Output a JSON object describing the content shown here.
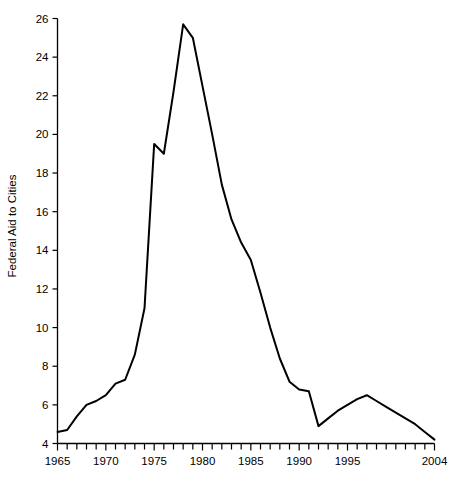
{
  "chart_data": {
    "type": "line",
    "title": "",
    "xlabel": "",
    "ylabel": "Federal Aid to Cities",
    "xlim": [
      1965,
      2004
    ],
    "ylim": [
      4,
      26
    ],
    "grid": false,
    "legend": false,
    "x_ticks_major": [
      1965,
      1970,
      1975,
      1980,
      1985,
      1990,
      1995,
      2004
    ],
    "x_tick_labels": [
      "1965",
      "1970",
      "1975",
      "1980",
      "1985",
      "1990",
      "1995",
      "2004"
    ],
    "x_minor_tick_step": 1,
    "y_ticks": [
      4,
      6,
      8,
      10,
      12,
      14,
      16,
      18,
      20,
      22,
      24,
      26
    ],
    "y_tick_labels": [
      "4",
      "6",
      "8",
      "10",
      "12",
      "14",
      "16",
      "18",
      "20",
      "22",
      "24",
      "26"
    ],
    "series": [
      {
        "name": "Federal Aid to Cities",
        "color": "#000000",
        "x": [
          1965,
          1966,
          1967,
          1968,
          1969,
          1970,
          1971,
          1972,
          1973,
          1974,
          1975,
          1976,
          1977,
          1978,
          1979,
          1980,
          1981,
          1982,
          1983,
          1984,
          1985,
          1986,
          1987,
          1988,
          1989,
          1990,
          1991,
          1992,
          1993,
          1994,
          1995,
          1996,
          1997,
          1998,
          1999,
          2000,
          2001,
          2002,
          2003,
          2004
        ],
        "values": [
          4.6,
          4.7,
          5.4,
          6.0,
          6.2,
          6.5,
          7.1,
          7.3,
          8.6,
          11.0,
          19.5,
          19.0,
          22.2,
          25.7,
          25.0,
          22.5,
          20.0,
          17.4,
          15.6,
          14.4,
          13.5,
          11.8,
          10.0,
          8.4,
          7.2,
          6.8,
          6.7,
          4.9,
          5.3,
          5.7,
          6.0,
          6.3,
          6.5,
          6.2,
          5.9,
          5.6,
          5.3,
          5.0,
          4.6,
          4.2
        ]
      }
    ]
  },
  "axes": {
    "y_axis_title": "Federal Aid to Cities",
    "line_color": "#000000",
    "axis_color": "#000000"
  }
}
